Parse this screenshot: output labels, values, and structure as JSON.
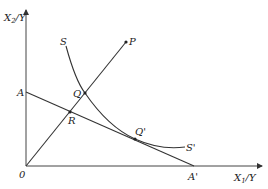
{
  "diagram": {
    "type": "economics-isoquant-diagram",
    "axes": {
      "y_label": "X",
      "y_label_sub": "2",
      "y_label_suffix": "/Y",
      "x_label": "X",
      "x_label_sub": "1",
      "x_label_suffix": "/Y",
      "origin_label": "0"
    },
    "points": {
      "A": "A",
      "A_prime": "A'",
      "P": "P",
      "Q": "Q",
      "Q_prime": "Q'",
      "R": "R",
      "S": "S",
      "S_prime": "S'"
    },
    "elements": [
      {
        "name": "isoquant SS'",
        "from": "S",
        "to": "S'",
        "passes_through": [
          "Q",
          "Q'"
        ]
      },
      {
        "name": "ray 0P",
        "from": "0",
        "to": "P",
        "passes_through": [
          "R",
          "Q"
        ]
      },
      {
        "name": "isocost AA'",
        "from": "A",
        "to": "A'",
        "passes_through": [
          "R",
          "Q'"
        ]
      }
    ]
  }
}
